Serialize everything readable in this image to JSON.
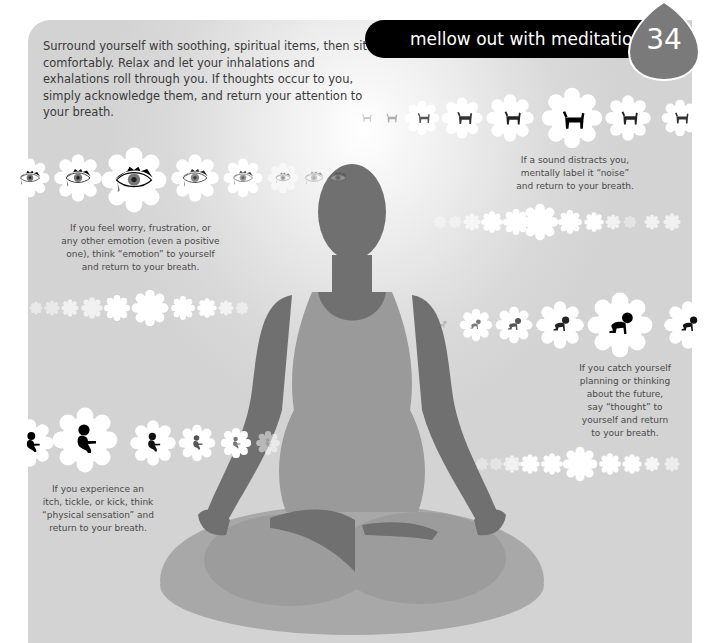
{
  "page": {
    "number": "34",
    "title": "mellow out with meditation",
    "intro": "Surround yourself with soothing, spiritual items, then sit comfortably. Relax and let your inhalations and exhalations roll through you. If thoughts occur to you, simply acknowledge them, and return your attention to your breath."
  },
  "captions": {
    "noise": [
      "If a sound distracts you,",
      "mentally label it “noise”",
      "and return to your breath."
    ],
    "emotion": [
      "If you feel worry, frustration, or",
      "any other emotion (even a positive",
      "one), think “emotion” to yourself",
      "and return to your breath."
    ],
    "thought": [
      "If you catch yourself",
      "planning or thinking",
      "about the future,",
      "say “thought” to",
      "yourself and return",
      "to your breath."
    ],
    "sensation": [
      "If you experience an",
      "itch, tickle, or kick, think",
      "“physical sensation” and",
      "return to your breath."
    ]
  },
  "icon_rows": {
    "dog": {
      "icon": "barking-dog-icon",
      "count": 9
    },
    "eye": {
      "icon": "crying-eye-icon",
      "count": 8
    },
    "crawling_baby": {
      "icon": "crawling-baby-icon",
      "count": 7
    },
    "fetus": {
      "icon": "fetus-icon",
      "count": 6
    }
  },
  "colors": {
    "panel": "#d6d6d6",
    "badge": "#7a7a7a",
    "title_bar": "#000000",
    "figure_dark": "#707070",
    "figure_light": "#9a9a9a",
    "cushion": "#a6a6a6"
  }
}
